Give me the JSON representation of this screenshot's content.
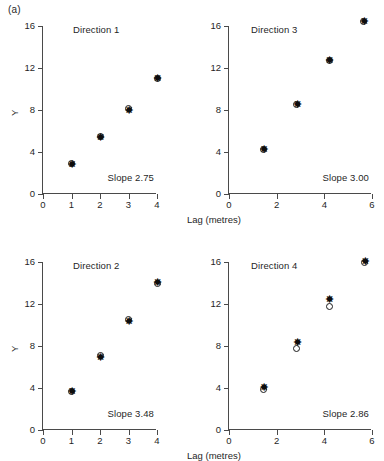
{
  "figure": {
    "panel_letter": "(a)"
  },
  "axes": {
    "y_title": "Y",
    "x_title": "Lag (metres)",
    "y_ticks": [
      "0",
      "4",
      "8",
      "12",
      "16"
    ],
    "y_tick_values": [
      0,
      4,
      8,
      12,
      16
    ],
    "x_ticks_left": [
      "0",
      "1",
      "2",
      "3",
      "4"
    ],
    "x_tick_values_left": [
      0,
      1,
      2,
      3,
      4
    ],
    "x_ticks_right": [
      "0",
      "2",
      "4",
      "6"
    ],
    "x_tick_values_right": [
      0,
      2,
      4,
      6
    ]
  },
  "chart_data": [
    {
      "type": "scatter",
      "title": "Direction 1",
      "annotation": "Slope 2.75",
      "slope": 2.75,
      "xlabel": "Lag (metres)",
      "ylabel": "Y",
      "xlim": [
        0,
        4
      ],
      "ylim": [
        0,
        16
      ],
      "grid": false,
      "series": [
        {
          "name": "estimate-circle",
          "marker": "open-circle",
          "x": [
            1.0,
            2.0,
            3.0,
            4.0
          ],
          "y": [
            2.9,
            5.5,
            8.1,
            11.0
          ]
        },
        {
          "name": "estimate-asterisk",
          "marker": "asterisk",
          "x": [
            1.0,
            2.0,
            3.0,
            4.0
          ],
          "y": [
            2.8,
            5.3,
            7.9,
            11.0
          ]
        }
      ]
    },
    {
      "type": "scatter",
      "title": "Direction 3",
      "annotation": "Slope 3.00",
      "slope": 3.0,
      "xlabel": "Lag (metres)",
      "ylabel": "Y",
      "xlim": [
        0,
        6
      ],
      "ylim": [
        0,
        16
      ],
      "grid": false,
      "series": [
        {
          "name": "estimate-circle",
          "marker": "open-circle",
          "x": [
            1.45,
            2.85,
            4.2,
            5.65
          ],
          "y": [
            4.2,
            8.5,
            12.7,
            16.4
          ]
        },
        {
          "name": "estimate-asterisk",
          "marker": "asterisk",
          "x": [
            1.45,
            2.85,
            4.2,
            5.65
          ],
          "y": [
            4.2,
            8.5,
            12.7,
            16.4
          ]
        }
      ]
    },
    {
      "type": "scatter",
      "title": "Direction 2",
      "annotation": "Slope 3.48",
      "slope": 3.48,
      "xlabel": "Lag (metres)",
      "ylabel": "Y",
      "xlim": [
        0,
        4
      ],
      "ylim": [
        0,
        16
      ],
      "grid": false,
      "series": [
        {
          "name": "estimate-circle",
          "marker": "open-circle",
          "x": [
            1.0,
            2.0,
            3.0,
            4.0
          ],
          "y": [
            3.7,
            7.1,
            10.5,
            14.0
          ]
        },
        {
          "name": "estimate-asterisk",
          "marker": "asterisk",
          "x": [
            1.0,
            2.0,
            3.0,
            4.0
          ],
          "y": [
            3.6,
            6.9,
            10.3,
            14.0
          ]
        }
      ]
    },
    {
      "type": "scatter",
      "title": "Direction 4",
      "annotation": "Slope 2.86",
      "slope": 2.86,
      "xlabel": "Lag (metres)",
      "ylabel": "Y",
      "xlim": [
        0,
        6
      ],
      "ylim": [
        0,
        16
      ],
      "grid": false,
      "series": [
        {
          "name": "estimate-circle",
          "marker": "open-circle",
          "x": [
            1.45,
            2.85,
            4.2,
            5.7
          ],
          "y": [
            3.9,
            7.8,
            11.8,
            16.0
          ]
        },
        {
          "name": "estimate-asterisk",
          "marker": "asterisk",
          "x": [
            1.45,
            2.85,
            4.2,
            5.7
          ],
          "y": [
            4.0,
            8.3,
            12.4,
            16.0
          ]
        }
      ]
    }
  ]
}
